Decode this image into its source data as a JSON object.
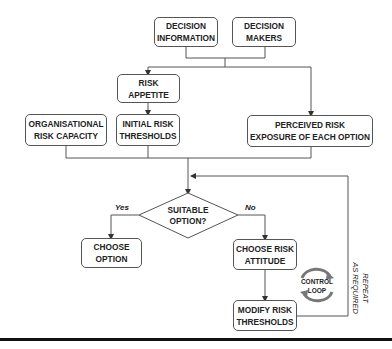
{
  "diagram": {
    "type": "flowchart",
    "nodes": {
      "decision_information": "DECISION\nINFORMATION",
      "decision_makers": "DECISION\nMAKERS",
      "risk_appetite": "RISK\nAPPETITE",
      "organisational_risk_capacity": "ORGANISATIONAL\nRISK CAPACITY",
      "initial_risk_thresholds": "INITIAL RISK\nTHRESHOLDS",
      "perceived_risk_exposure": "PERCEIVED RISK\nEXPOSURE OF EACH OPTION",
      "suitable_option": "SUITABLE\nOPTION?",
      "choose_option": "CHOOSE\nOPTION",
      "choose_risk_attitude": "CHOOSE RISK\nATTITUDE",
      "modify_risk_thresholds": "MODIFY RISK\nTHRESHOLDS"
    },
    "branch_labels": {
      "yes": "Yes",
      "no": "No"
    },
    "control_loop_label": "CONTROL\nLOOP",
    "repeat_label": "REPEAT\nAS REQUIRED",
    "edges": [
      {
        "from": "decision_information",
        "to": "risk_appetite"
      },
      {
        "from": "decision_makers",
        "to": "risk_appetite"
      },
      {
        "from": "decision_information",
        "to": "perceived_risk_exposure"
      },
      {
        "from": "decision_makers",
        "to": "perceived_risk_exposure"
      },
      {
        "from": "risk_appetite",
        "to": "initial_risk_thresholds"
      },
      {
        "from": "organisational_risk_capacity",
        "to": "suitable_option"
      },
      {
        "from": "initial_risk_thresholds",
        "to": "suitable_option"
      },
      {
        "from": "perceived_risk_exposure",
        "to": "suitable_option"
      },
      {
        "from": "suitable_option",
        "to": "choose_option",
        "label": "Yes"
      },
      {
        "from": "suitable_option",
        "to": "choose_risk_attitude",
        "label": "No"
      },
      {
        "from": "choose_risk_attitude",
        "to": "modify_risk_thresholds"
      },
      {
        "from": "modify_risk_thresholds",
        "to": "suitable_option",
        "label": "REPEAT AS REQUIRED"
      }
    ]
  }
}
